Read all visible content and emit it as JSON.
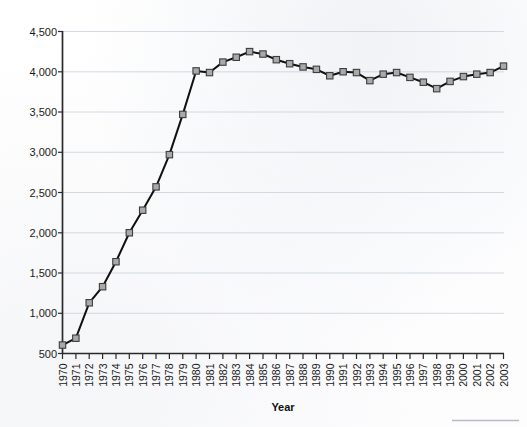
{
  "chart_data": {
    "type": "line",
    "title": "",
    "xlabel": "Year",
    "ylabel": "",
    "ylim": [
      500,
      4500
    ],
    "ytick_labels": [
      "500",
      "1,000",
      "1,500",
      "2,000",
      "2,500",
      "3,000",
      "3,500",
      "4,000",
      "4,500"
    ],
    "ytick_values": [
      500,
      1000,
      1500,
      2000,
      2500,
      3000,
      3500,
      4000,
      4500
    ],
    "grid": true,
    "legend": "none",
    "marker": "square",
    "categories": [
      "1970",
      "1971",
      "1972",
      "1973",
      "1974",
      "1975",
      "1976",
      "1977",
      "1978",
      "1979",
      "1980",
      "1981",
      "1982",
      "1983",
      "1984",
      "1985",
      "1986",
      "1987",
      "1988",
      "1989",
      "1990",
      "1991",
      "1992",
      "1993",
      "1994",
      "1995",
      "1996",
      "1997",
      "1998",
      "1999",
      "2000",
      "2001",
      "2002",
      "2003"
    ],
    "values": [
      605,
      690,
      1130,
      1330,
      1640,
      2000,
      2280,
      2570,
      2970,
      3470,
      4010,
      3990,
      4120,
      4180,
      4250,
      4220,
      4150,
      4100,
      4060,
      4030,
      3950,
      4000,
      3990,
      3890,
      3970,
      3990,
      3930,
      3870,
      3790,
      3880,
      3940,
      3970,
      3990,
      4070
    ],
    "series": [
      {
        "name": "series-1",
        "values": [
          605,
          690,
          1130,
          1330,
          1640,
          2000,
          2280,
          2570,
          2970,
          3470,
          4010,
          3990,
          4120,
          4180,
          4250,
          4220,
          4150,
          4100,
          4060,
          4030,
          3950,
          4000,
          3990,
          3890,
          3970,
          3990,
          3930,
          3870,
          3790,
          3880,
          3940,
          3970,
          3990,
          4070
        ]
      }
    ],
    "colors": {
      "line": "#101010",
      "marker_fill": "#a9a9a9",
      "marker_stroke": "#3d3d3d",
      "grid": "#c9cfdb",
      "axis": "#2a2a2a",
      "text": "#161616"
    }
  }
}
